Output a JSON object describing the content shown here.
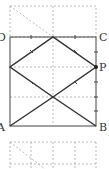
{
  "diagram": {
    "labels": {
      "D": "D",
      "C": "C",
      "P": "P",
      "A": "A",
      "B": "B"
    },
    "colors": {
      "solid": "#333333",
      "dashed": "#999999",
      "background": "#ffffff"
    }
  }
}
